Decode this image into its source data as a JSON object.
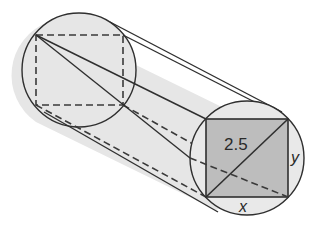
{
  "diagram": {
    "type": "cylinder-with-inscribed-rectangular-prism",
    "colors": {
      "background": "#ffffff",
      "cylinder_fill": "#e6e6e6",
      "front_square_fill": "#bdbdbd",
      "stroke": "#2f2f2f"
    },
    "labels": {
      "diagonal": "2.5",
      "height_side": "y",
      "width_side": "x"
    },
    "back_face": {
      "circle": {
        "cx": 79,
        "cy": 70,
        "r": 57
      },
      "square": {
        "x1": 36,
        "y1": 35,
        "x2": 123,
        "y2": 105
      }
    },
    "front_face": {
      "circle": {
        "cx": 247,
        "cy": 158,
        "r": 57
      },
      "square": {
        "x1": 206,
        "y1": 119,
        "x2": 288,
        "y2": 197
      }
    }
  }
}
